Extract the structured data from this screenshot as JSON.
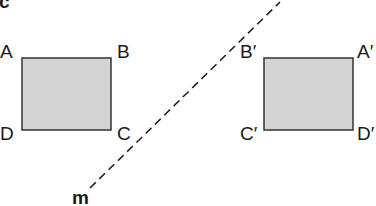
{
  "figure": {
    "section_label": "c",
    "mirror_line": {
      "label": "m",
      "style": "dashed",
      "from": [
        90,
        188
      ],
      "to": [
        280,
        2
      ]
    },
    "original": {
      "name": "ABCD",
      "fill": "#d4d4d4",
      "stroke": "#333333",
      "vertices": {
        "A": "A",
        "B": "B",
        "C": "C",
        "D": "D"
      }
    },
    "image": {
      "name": "A'B'C'D'",
      "fill": "#d4d4d4",
      "stroke": "#333333",
      "vertices": {
        "A": "A′",
        "B": "B′",
        "C": "C′",
        "D": "D′"
      }
    }
  }
}
